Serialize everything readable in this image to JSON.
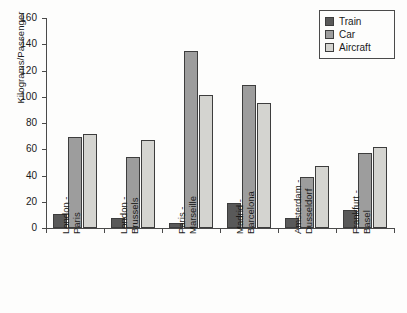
{
  "chart_data": {
    "type": "bar",
    "title": "",
    "subtitle": "",
    "xlabel": "",
    "ylabel": "Kilograms/Passenger",
    "ylim": [
      0,
      160
    ],
    "ytick_step": 20,
    "yticks": [
      "160",
      "140",
      "120",
      "100",
      "80",
      "60",
      "40",
      "20",
      "0"
    ],
    "grid": false,
    "legend_position": "top-right",
    "categories": [
      "London - Paris",
      "London - Brussels",
      "Paris - Marseille",
      "Madrid - Barcelona",
      "Amsterdam - Dusseldorf",
      "Frankfurt - Basel"
    ],
    "category_lines": [
      [
        "London -",
        "Paris"
      ],
      [
        "London -",
        "Brussels"
      ],
      [
        "Paris -",
        "Marseille"
      ],
      [
        "Madrid -",
        "Barcelona"
      ],
      [
        "Amsterdam -",
        "Dusseldorf"
      ],
      [
        "Frankfurt -",
        "Basel"
      ]
    ],
    "series": [
      {
        "name": "Train",
        "color": "#595959",
        "values": [
          11,
          8,
          4,
          19,
          8,
          14
        ]
      },
      {
        "name": "Car",
        "color": "#9d9d9d",
        "values": [
          69,
          54,
          135,
          109,
          39,
          57
        ]
      },
      {
        "name": "Aircraft",
        "color": "#d4d4d0",
        "values": [
          72,
          67,
          101,
          95,
          47,
          62
        ]
      }
    ]
  },
  "legend": {
    "items": [
      {
        "label": "Train",
        "key": "train"
      },
      {
        "label": "Car",
        "key": "car"
      },
      {
        "label": "Aircraft",
        "key": "aircraft"
      }
    ]
  }
}
